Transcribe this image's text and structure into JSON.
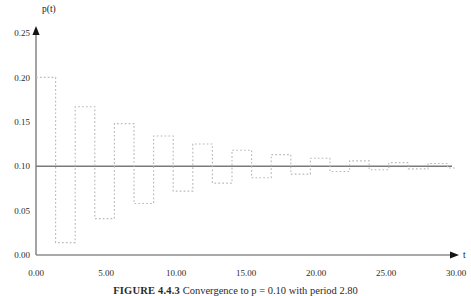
{
  "caption": {
    "label": "FIGURE 4.4.3",
    "text": "Convergence to p = 0.10 with period 2.80"
  },
  "chart_data": {
    "type": "line",
    "title": "",
    "xlabel": "t",
    "ylabel": "p(t)",
    "xlim": [
      0.0,
      30.0
    ],
    "ylim": [
      0.0,
      0.25
    ],
    "grid": false,
    "legend_position": "none",
    "line_style": "dotted",
    "line_color": "#b9b9b9",
    "equilibrium_line": {
      "value": 0.1,
      "color": "#7a7a7a",
      "style": "solid"
    },
    "x_tick_labels": [
      "0.00",
      "5.00",
      "10.00",
      "15.00",
      "20.00",
      "25.00",
      "30.00"
    ],
    "x_ticks": [
      0,
      5,
      10,
      15,
      20,
      25,
      30
    ],
    "y_tick_labels": [
      "0.00",
      "0.05",
      "0.10",
      "0.15",
      "0.20",
      "0.25"
    ],
    "y_ticks": [
      0.0,
      0.05,
      0.1,
      0.15,
      0.2,
      0.25
    ],
    "half_period": 1.4,
    "equilibrium": 0.1,
    "x": [
      0.0,
      1.4,
      1.4,
      2.8,
      2.8,
      4.2,
      4.2,
      5.6,
      5.6,
      7.0,
      7.0,
      8.4,
      8.4,
      9.8,
      9.8,
      11.2,
      11.2,
      12.6,
      12.6,
      14.0,
      14.0,
      15.4,
      15.4,
      16.8,
      16.8,
      18.2,
      18.2,
      19.6,
      19.6,
      21.0,
      21.0,
      22.4,
      22.4,
      23.8,
      23.8,
      25.2,
      25.2,
      26.6,
      26.6,
      28.0,
      28.0,
      29.4,
      29.4,
      30.0
    ],
    "y": [
      0.2,
      0.2,
      0.014,
      0.014,
      0.167,
      0.167,
      0.041,
      0.041,
      0.148,
      0.148,
      0.058,
      0.058,
      0.134,
      0.134,
      0.072,
      0.072,
      0.125,
      0.125,
      0.081,
      0.081,
      0.118,
      0.118,
      0.087,
      0.087,
      0.113,
      0.113,
      0.091,
      0.091,
      0.109,
      0.109,
      0.094,
      0.094,
      0.106,
      0.106,
      0.096,
      0.096,
      0.104,
      0.104,
      0.097,
      0.097,
      0.103,
      0.103,
      0.098,
      0.098
    ],
    "peaks": [
      0.2,
      0.167,
      0.148,
      0.134,
      0.125,
      0.118,
      0.113,
      0.109,
      0.106,
      0.104,
      0.103
    ],
    "troughs": [
      0.014,
      0.041,
      0.058,
      0.072,
      0.081,
      0.087,
      0.091,
      0.094,
      0.096,
      0.097,
      0.098
    ]
  }
}
